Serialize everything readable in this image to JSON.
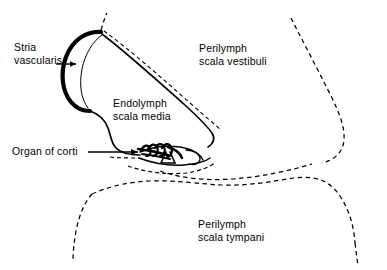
{
  "figure": {
    "background_color": "#ffffff",
    "ink_color": "#000000",
    "width": 387,
    "height": 270
  },
  "labels": {
    "stria_vascularis": "Stria\nvascularis",
    "endolymph_scala_media": "Endolymph\nscala media",
    "perilymph_scala_vestibuli": "Perilymph\nscala vestibuli",
    "perilymph_scala_tympani": "Perilymph\nscala tympani",
    "organ_of_corti": "Organ of corti"
  },
  "structures": [
    {
      "name": "stria-vascularis-band",
      "style": "thick-solid-crescent"
    },
    {
      "name": "reissners-membrane",
      "style": "solid-line-with-parallel-dashed"
    },
    {
      "name": "spiral-limbus-wall",
      "style": "solid-curve"
    },
    {
      "name": "organ-of-corti-hair-cells",
      "style": "solid-detail-cluster"
    },
    {
      "name": "basilar-membrane",
      "style": "dashed-line"
    },
    {
      "name": "bony-wall-scala-vestibuli",
      "style": "dashed-outline"
    },
    {
      "name": "bony-wall-scala-tympani",
      "style": "dashed-outline"
    }
  ],
  "leaders": [
    {
      "name": "stria-vascularis-leader",
      "style": "short-arrow-right"
    },
    {
      "name": "organ-of-corti-leader",
      "style": "long-arrow-right"
    }
  ]
}
